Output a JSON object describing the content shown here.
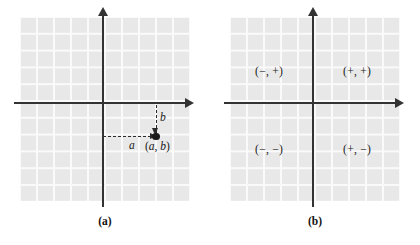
{
  "figure": {
    "type": "coordinate-plane-diagram",
    "panel_count": 2
  },
  "chart_data": {
    "type": "scatter",
    "title": "",
    "xlabel": "",
    "ylabel": "",
    "panels": [
      {
        "id": "a",
        "caption": "(a)",
        "description": "Cartesian coordinate plane with a single plotted point in the fourth quadrant, labeled with its coordinates and dashed leader lines for the horizontal and vertical displacements.",
        "axes": {
          "x_axis": "horizontal",
          "y_axis": "vertical",
          "origin_label": "",
          "grid": true,
          "arrowheads": [
            "right",
            "up"
          ]
        },
        "points": [
          {
            "label": "(a, b)",
            "quadrant": 4,
            "x_leader_label": "a",
            "y_leader_label": "b"
          }
        ],
        "annotations": [
          {
            "name": "x-displacement",
            "text": "a"
          },
          {
            "name": "y-displacement",
            "text": "b"
          },
          {
            "name": "point-coordinates",
            "text": "(a, b)"
          }
        ]
      },
      {
        "id": "b",
        "caption": "(b)",
        "description": "Cartesian coordinate plane with the sign of the coordinates labeled in each of the four quadrants.",
        "axes": {
          "x_axis": "horizontal",
          "y_axis": "vertical",
          "grid": true,
          "arrowheads": [
            "right",
            "up"
          ]
        },
        "quadrant_labels": [
          {
            "quadrant": 2,
            "text": "(−, +)"
          },
          {
            "quadrant": 1,
            "text": "(+, +)"
          },
          {
            "quadrant": 3,
            "text": "(−, −)"
          },
          {
            "quadrant": 4,
            "text": "(+, −)"
          }
        ]
      }
    ]
  },
  "panel_a": {
    "caption": "(a)",
    "label_a": "a",
    "label_b": "b",
    "point_open_paren": "(",
    "point_a": "a",
    "point_comma": ", ",
    "point_b": "b",
    "point_close_paren": ")"
  },
  "panel_b": {
    "caption": "(b)",
    "quadrant_2": "(−, +)",
    "quadrant_1": "(+, +)",
    "quadrant_3": "(−, −)",
    "quadrant_4": "(+, −)"
  },
  "colors": {
    "background": "#ffffff",
    "grid_fill": "#e8e8e8",
    "grid_line": "#fafafa",
    "axis": "#333333",
    "text": "#1a1a1a",
    "dashed_leader": "#2b2b2b"
  }
}
